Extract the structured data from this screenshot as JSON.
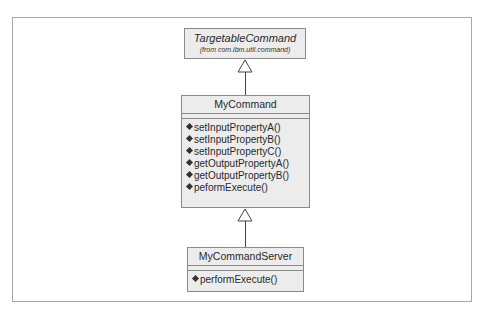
{
  "diagram": {
    "type": "UML class diagram",
    "classes": [
      {
        "id": "targetable",
        "name": "TargetableCommand",
        "from_label": "(from com.ibm.util.command)",
        "operations": []
      },
      {
        "id": "mycommand",
        "name": "MyCommand",
        "operations": [
          "setInputPropertyA()",
          "setInputPropertyB()",
          "setInputPropertyC()",
          "getOutputPropertyA()",
          "getOutputPropertyB()",
          "peformExecute()"
        ]
      },
      {
        "id": "server",
        "name": "MyCommandServer",
        "operations": [
          "performExecute()"
        ]
      }
    ],
    "relations": [
      {
        "type": "generalization",
        "from": "MyCommand",
        "to": "TargetableCommand"
      },
      {
        "type": "generalization",
        "from": "MyCommandServer",
        "to": "MyCommand"
      }
    ],
    "colors": {
      "box_fill": "#ececec",
      "box_border": "#8a8a8a",
      "frame_border": "#a8a8a8"
    }
  }
}
